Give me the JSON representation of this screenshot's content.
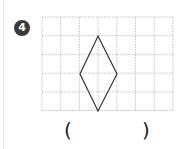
{
  "problem": {
    "number": "4",
    "answer_open": "(",
    "answer_close": ")"
  },
  "grid": {
    "x": 42,
    "y": 17,
    "cols": 7,
    "rows": 5,
    "cell": 18.7,
    "line_color": "#b5b5b5"
  },
  "shape": {
    "type": "rhombus",
    "points": [
      [
        98,
        36
      ],
      [
        117,
        74
      ],
      [
        98,
        111
      ],
      [
        80,
        74
      ]
    ],
    "stroke": "#333333"
  }
}
